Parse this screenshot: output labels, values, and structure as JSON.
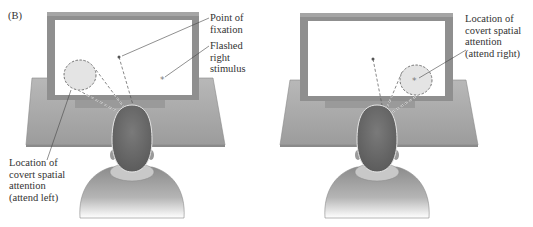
{
  "panel_label": "(B)",
  "left_panel": {
    "condition": "attend left",
    "labels": {
      "fixation": [
        "Point of",
        "fixation"
      ],
      "stimulus": [
        "Flashed",
        "right",
        "stimulus"
      ],
      "attention": [
        "Location of",
        "covert spatial",
        "attention",
        "(attend left)"
      ]
    }
  },
  "right_panel": {
    "condition": "attend right",
    "labels": {
      "attention": [
        "Location of",
        "covert spatial",
        "attention",
        "(attend right)"
      ]
    }
  },
  "colors": {
    "monitor_frame": "#8a8a8a",
    "screen": "#ffffff",
    "desk": "#a9a9a9",
    "head": "#6e6e6e",
    "shirt": "#9a9a9a",
    "attention_spot": "#e4e4e4",
    "text": "#333333"
  },
  "symbols": {
    "stimulus": "*"
  }
}
